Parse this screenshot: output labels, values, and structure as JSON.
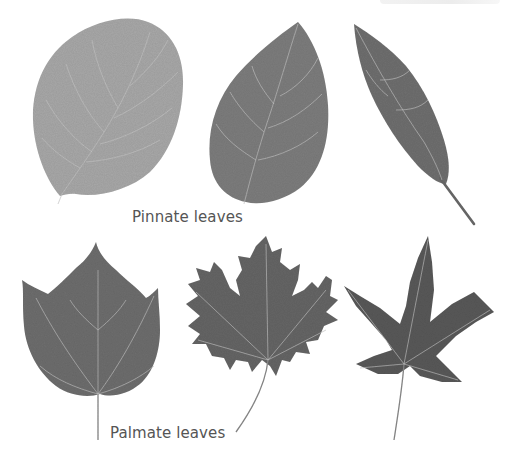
{
  "figure": {
    "groups": [
      {
        "label": "Pinnate leaves",
        "leaves": [
          {
            "name": "rounded-serrate-leaf",
            "tone": "#a9a9a9"
          },
          {
            "name": "ovate-leaf",
            "tone": "#7e7e7e"
          },
          {
            "name": "lanceolate-leaf",
            "tone": "#707070"
          }
        ]
      },
      {
        "label": "Palmate leaves",
        "leaves": [
          {
            "name": "three-lobed-leaf",
            "tone": "#6e6e6e"
          },
          {
            "name": "maple-leaf",
            "tone": "#666666"
          },
          {
            "name": "japanese-maple-leaf",
            "tone": "#5a5a5a"
          }
        ]
      }
    ],
    "colors": {
      "background": "#ffffff",
      "label_text": "#555555",
      "vein": "#c8c8c8"
    }
  }
}
